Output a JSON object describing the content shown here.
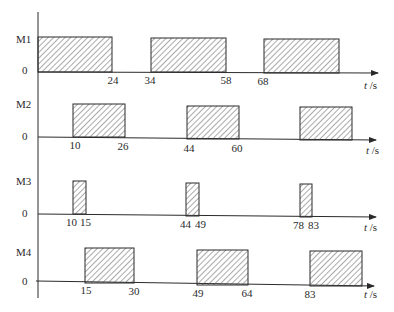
{
  "diagram": {
    "title": "",
    "time_unit": "t /s",
    "time_unit_var": "t",
    "time_unit_suffix": " /s",
    "zero_label": "0",
    "colors": {
      "line": "#2a2a2a",
      "hatch": "#555555",
      "background": "#ffffff"
    },
    "rows": [
      {
        "name": "M1",
        "pulses": [
          {
            "start": 0,
            "end": 24
          },
          {
            "start": 34,
            "end": 58
          },
          {
            "start": 68,
            "end": 92
          }
        ],
        "tick_labels": [
          "24",
          "34",
          "58",
          "68"
        ]
      },
      {
        "name": "M2",
        "pulses": [
          {
            "start": 10,
            "end": 26
          },
          {
            "start": 44,
            "end": 60
          },
          {
            "start": 78,
            "end": 94
          }
        ],
        "tick_labels": [
          "10",
          "26",
          "44",
          "60"
        ]
      },
      {
        "name": "M3",
        "pulses": [
          {
            "start": 10,
            "end": 15
          },
          {
            "start": 44,
            "end": 49
          },
          {
            "start": 78,
            "end": 83
          }
        ],
        "tick_labels": [
          "10",
          "15",
          "44",
          "49",
          "78",
          "83"
        ]
      },
      {
        "name": "M4",
        "pulses": [
          {
            "start": 15,
            "end": 30
          },
          {
            "start": 49,
            "end": 64
          },
          {
            "start": 83,
            "end": 99
          }
        ],
        "tick_labels": [
          "15",
          "30",
          "49",
          "64",
          "83"
        ]
      }
    ]
  }
}
